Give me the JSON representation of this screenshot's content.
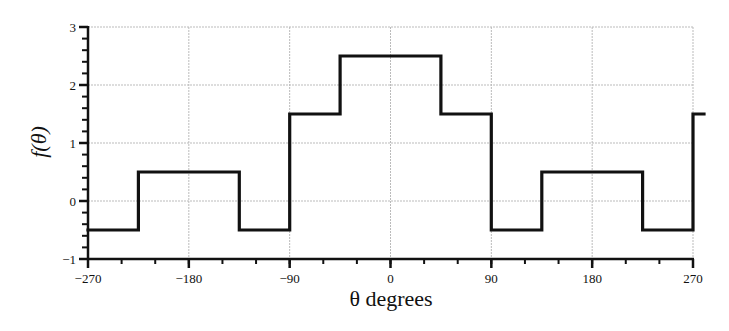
{
  "chart_data": {
    "type": "line",
    "style": "step",
    "title": "",
    "xlabel": "θ degrees",
    "ylabel": "f(θ)",
    "xlim": [
      -270,
      270
    ],
    "ylim": [
      -1,
      3
    ],
    "x_ticks": [
      -270,
      -180,
      -90,
      0,
      90,
      180,
      270
    ],
    "x_tick_labels": [
      "−270",
      "−180",
      "−90",
      "0",
      "90",
      "180",
      "270"
    ],
    "x_minor_step": 30,
    "y_ticks": [
      -1,
      0,
      1,
      2,
      3
    ],
    "y_tick_labels": [
      "−1",
      "0",
      "1",
      "2",
      "3"
    ],
    "y_minor_step": 0.2,
    "grid": true,
    "legend": null,
    "series": [
      {
        "name": "f(θ)",
        "color": "#111111",
        "segments": [
          {
            "x0": -270,
            "x1": -225,
            "y": -0.5
          },
          {
            "x0": -225,
            "x1": -135,
            "y": 0.5
          },
          {
            "x0": -135,
            "x1": -90,
            "y": -0.5
          },
          {
            "x0": -90,
            "x1": -45,
            "y": 1.5
          },
          {
            "x0": -45,
            "x1": 45,
            "y": 2.5
          },
          {
            "x0": 45,
            "x1": 90,
            "y": 1.5
          },
          {
            "x0": 90,
            "x1": 135,
            "y": -0.5
          },
          {
            "x0": 135,
            "x1": 225,
            "y": 0.5
          },
          {
            "x0": 225,
            "x1": 270,
            "y": -0.5
          },
          {
            "x0": 270,
            "x1": 280,
            "y": 1.5
          }
        ],
        "x": [
          -270,
          -225,
          -225,
          -135,
          -135,
          -90,
          -90,
          -45,
          -45,
          45,
          45,
          90,
          90,
          135,
          135,
          225,
          225,
          270,
          270,
          280
        ],
        "y": [
          -0.5,
          -0.5,
          0.5,
          0.5,
          -0.5,
          -0.5,
          1.5,
          1.5,
          2.5,
          2.5,
          1.5,
          1.5,
          -0.5,
          -0.5,
          0.5,
          0.5,
          -0.5,
          -0.5,
          1.5,
          1.5
        ]
      }
    ]
  }
}
